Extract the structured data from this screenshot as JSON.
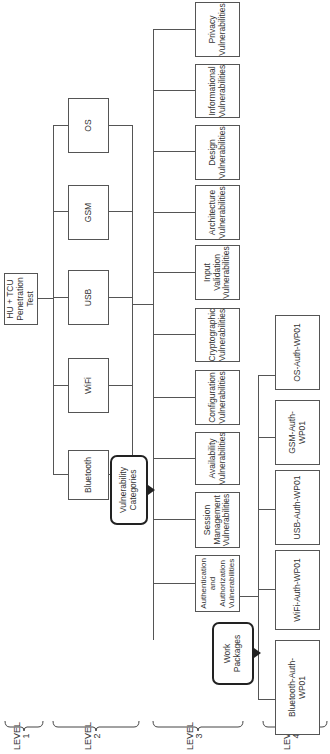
{
  "diagram": {
    "root": {
      "label": "HU + TCU\nPenetration\nTest"
    },
    "level2": [
      {
        "label": "Bluetooth"
      },
      {
        "label": "WiFi"
      },
      {
        "label": "USB"
      },
      {
        "label": "GSM"
      },
      {
        "label": "OS"
      }
    ],
    "level3": [
      {
        "label": "Authentication\nand\nAuthorization\nVulnerabilities"
      },
      {
        "label": "Session\nManagement\nVulnerabilities"
      },
      {
        "label": "Availability\nVulnerabilities"
      },
      {
        "label": "Configuration\nVulnerabilities"
      },
      {
        "label": "Cryptographic\nVulnerabilities"
      },
      {
        "label": "Input\nValidation\nVulnerabilities"
      },
      {
        "label": "Architecture\nVulnerabilities"
      },
      {
        "label": "Design\nVulnerabilities"
      },
      {
        "label": "Informational\nVulnerabilities"
      },
      {
        "label": "Privacy\nVulnerabilities"
      }
    ],
    "level4": [
      {
        "label": "Bluetooth-Auth-\nWP01"
      },
      {
        "label": "WiFi-Auth-WP01"
      },
      {
        "label": "USB-Auth-WP01"
      },
      {
        "label": "GSM-Auth-WP01"
      },
      {
        "label": "OS-Auth-WP01"
      }
    ],
    "callouts": {
      "vulnerability_categories": "Vulnerability\nCategories",
      "work_packages": "Work\nPackages"
    },
    "levels": [
      {
        "label": "LEVEL\n1"
      },
      {
        "label": "LEVEL\n2"
      },
      {
        "label": "LEVEL\n3"
      },
      {
        "label": "LEVEL\n4"
      }
    ],
    "colors": {
      "line": "#555555",
      "callout_border": "#222222",
      "background": "#ffffff"
    }
  }
}
